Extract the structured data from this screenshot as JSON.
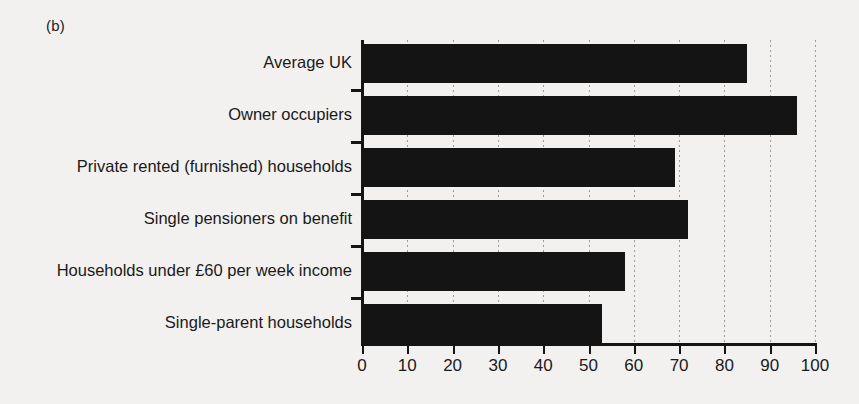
{
  "figure": {
    "panel_label": "(b)",
    "background_color": "#f2f1ef",
    "bar_color": "#141414",
    "axis_color": "#141414",
    "gridline_color": "#9a9a98"
  },
  "chart_data": {
    "type": "bar",
    "orientation": "horizontal",
    "title": "",
    "subtitle": "",
    "xlabel": "",
    "ylabel": "",
    "categories": [
      "Average UK",
      "Owner occupiers",
      "Private rented (furnished) households",
      "Single pensioners on benefit",
      "Households under £60 per week income",
      "Single-parent households"
    ],
    "values": [
      85,
      96,
      69,
      72,
      58,
      53
    ],
    "xlim": [
      0,
      100
    ],
    "xticks": [
      0,
      10,
      20,
      30,
      40,
      50,
      60,
      70,
      80,
      90,
      100
    ],
    "xtick_labels": [
      "0",
      "10",
      "20",
      "30",
      "40",
      "50",
      "60",
      "70",
      "80",
      "90",
      "100"
    ],
    "grid": true,
    "grid_axis": "x",
    "grid_style": "dotted",
    "legend": null,
    "legend_position": "none"
  }
}
